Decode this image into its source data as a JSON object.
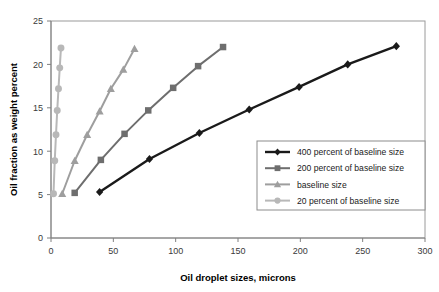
{
  "chart_data": {
    "type": "line",
    "title": "",
    "xlabel": "Oil droplet sizes, microns",
    "ylabel": "Oil fraction as weight percent",
    "xlim": [
      0,
      300
    ],
    "ylim": [
      0,
      25
    ],
    "xticks": [
      0,
      50,
      100,
      150,
      200,
      250,
      300
    ],
    "yticks": [
      0,
      5,
      10,
      15,
      20,
      25
    ],
    "xtick_labels": [
      "0",
      "50",
      "100",
      "150",
      "200",
      "250",
      "300"
    ],
    "ytick_labels": [
      "0",
      "5",
      "10",
      "15",
      "20",
      "25"
    ],
    "grid": false,
    "legend_position": "inside-lower-right",
    "series": [
      {
        "name": "400 percent of baseline size",
        "color": "#1a1a1a",
        "marker": "diamond",
        "x": [
          39,
          79,
          119,
          159,
          199,
          238,
          277
        ],
        "y": [
          5.3,
          9.1,
          12.1,
          14.8,
          17.4,
          20.0,
          22.1
        ]
      },
      {
        "name": "200 percent of baseline size",
        "color": "#6e6e6e",
        "marker": "square",
        "x": [
          19,
          40,
          59,
          78,
          98,
          118,
          138
        ],
        "y": [
          5.2,
          9.0,
          12.0,
          14.7,
          17.3,
          19.8,
          22.0
        ]
      },
      {
        "name": "baseline size",
        "color": "#9e9e9e",
        "marker": "triangle",
        "x": [
          9,
          19,
          29,
          39,
          48,
          58,
          67
        ],
        "y": [
          5.1,
          8.9,
          11.9,
          14.6,
          17.2,
          19.4,
          21.8
        ]
      },
      {
        "name": "20 percent of baseline size",
        "color": "#b8b8b8",
        "marker": "circle",
        "x": [
          2,
          3,
          4,
          5,
          6,
          7,
          8
        ],
        "y": [
          5.1,
          8.9,
          11.9,
          14.7,
          17.2,
          19.6,
          21.9
        ]
      }
    ]
  },
  "legend": {
    "entries": [
      {
        "label": "400 percent of baseline size",
        "color": "#1a1a1a",
        "marker": "diamond"
      },
      {
        "label": "200 percent of baseline size",
        "color": "#6e6e6e",
        "marker": "square"
      },
      {
        "label": "baseline size",
        "color": "#9e9e9e",
        "marker": "triangle"
      },
      {
        "label": "20 percent of baseline size",
        "color": "#b8b8b8",
        "marker": "circle"
      }
    ]
  }
}
